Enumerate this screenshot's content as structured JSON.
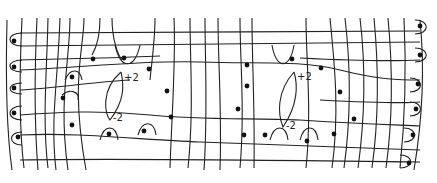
{
  "diagram": {
    "lenses": [
      {
        "top_label": "+2",
        "bottom_label": "-2"
      },
      {
        "top_label": "+2",
        "bottom_label": "-2"
      }
    ],
    "colors": {
      "stroke": "#222222",
      "background": "#ffffff"
    }
  }
}
